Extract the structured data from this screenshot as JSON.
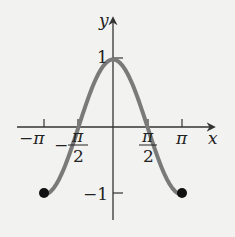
{
  "chart_data": {
    "type": "line",
    "title": "",
    "function": "y = cos x",
    "xlabel": "x",
    "ylabel": "y",
    "xlim": [
      -3.14159,
      3.14159
    ],
    "ylim": [
      -1,
      1
    ],
    "x_ticks": [
      {
        "value": -3.14159,
        "label": "−π"
      },
      {
        "value": -1.5708,
        "label": "−π/2"
      },
      {
        "value": 1.5708,
        "label": "π/2"
      },
      {
        "value": 3.14159,
        "label": "π"
      }
    ],
    "y_ticks": [
      {
        "value": 1,
        "label": "1"
      },
      {
        "value": -1,
        "label": "−1"
      }
    ],
    "series": [
      {
        "name": "cos x",
        "color": "#7a7a7a",
        "x": [
          -3.14159,
          -2.3562,
          -1.5708,
          -0.7854,
          0,
          0.7854,
          1.5708,
          2.3562,
          3.14159
        ],
        "y": [
          -1,
          -0.7071,
          0,
          0.7071,
          1,
          0.7071,
          0,
          -0.7071,
          -1
        ]
      }
    ],
    "endpoints": [
      {
        "x": -3.14159,
        "y": -1,
        "style": "closed"
      },
      {
        "x": 3.14159,
        "y": -1,
        "style": "closed"
      }
    ],
    "grid": false,
    "legend": false
  },
  "labels": {
    "x_axis": "x",
    "y_axis": "y",
    "y_one": "1",
    "y_neg_one": "−1",
    "neg_pi": "−π",
    "pi": "π",
    "pi_num": "π",
    "two": "2",
    "minus": "−"
  },
  "colors": {
    "curve": "#7a7a7a",
    "axis": "#333333",
    "dot": "#111111",
    "background": "#f2f2f0"
  }
}
